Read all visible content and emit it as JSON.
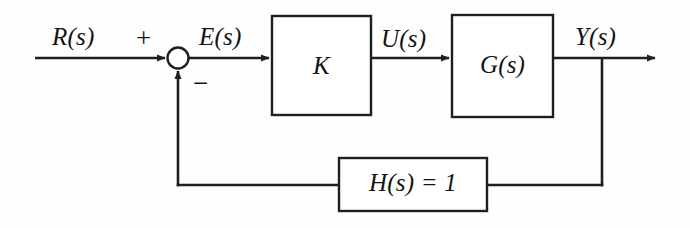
{
  "diagram": {
    "colors": {
      "background": "#fefefe",
      "line": "#1f1f1f",
      "text": "#141414",
      "block_fill": "#ffffff"
    },
    "signals": {
      "reference": "R(s)",
      "error": "E(s)",
      "control": "U(s)",
      "output": "Y(s)"
    },
    "signs": {
      "positive": "+",
      "negative": "−"
    },
    "blocks": {
      "gain": "K",
      "plant": "G(s)",
      "feedback": "H(s) = 1"
    }
  }
}
